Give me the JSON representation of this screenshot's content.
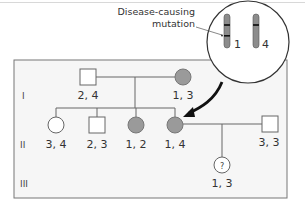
{
  "annotation": {
    "line1": "Disease-causing",
    "line2": "mutation"
  },
  "chromosomes": [
    {
      "label": "1",
      "has_mutation": true
    },
    {
      "label": "4",
      "has_mutation": false
    }
  ],
  "generations": [
    "I",
    "II",
    "III"
  ],
  "individuals": {
    "gen1_father": {
      "sex": "male",
      "affected": false,
      "genotype": "2, 4"
    },
    "gen1_mother": {
      "sex": "female",
      "affected": true,
      "genotype": "1, 3"
    },
    "gen2_daughter_a": {
      "sex": "female",
      "affected": false,
      "genotype": "3, 4"
    },
    "gen2_son": {
      "sex": "male",
      "affected": false,
      "genotype": "2, 3"
    },
    "gen2_daughter_b": {
      "sex": "female",
      "affected": true,
      "genotype": "1, 2"
    },
    "gen2_daughter_c": {
      "sex": "female",
      "affected": true,
      "genotype": "1, 4"
    },
    "gen2_spouse": {
      "sex": "male",
      "affected": false,
      "genotype": "3, 3"
    },
    "gen3_child": {
      "sex": "female",
      "affected": "unknown",
      "symbol": "?",
      "genotype": "1, 3"
    }
  },
  "colors": {
    "affected_fill": "#9a9a9a",
    "unaffected_fill": "#ffffff",
    "panel_bg": "#f6f6f6",
    "line": "#666666"
  }
}
